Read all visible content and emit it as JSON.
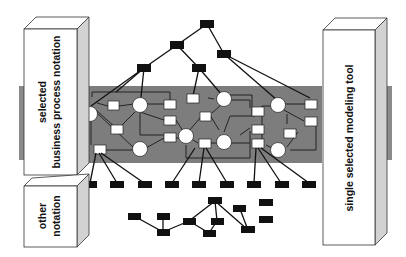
{
  "diagram": {
    "left_upper_box": {
      "label_line1": "selected",
      "label_line2": "business process notation"
    },
    "left_lower_box": {
      "label_line1": "other",
      "label_line2": "notation"
    },
    "right_box": {
      "label": "single selected modeling tool"
    },
    "colors": {
      "band": "#7d7d7d",
      "block_nodes": "#111111",
      "box_side": "#d2d2d2",
      "background": "#ffffff"
    },
    "upper_tree": {
      "nodes": [
        {
          "id": "t0",
          "x": 207,
          "y": 24
        },
        {
          "id": "t1",
          "x": 177,
          "y": 45
        },
        {
          "id": "t2",
          "x": 224,
          "y": 54
        },
        {
          "id": "t3",
          "x": 144,
          "y": 68
        },
        {
          "id": "t4",
          "x": 199,
          "y": 68
        }
      ]
    },
    "bottom_row_count": 9,
    "lower_tree_count": 11
  }
}
